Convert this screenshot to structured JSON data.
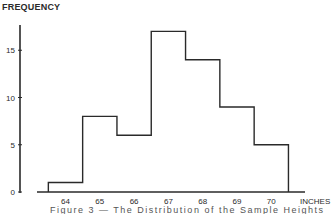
{
  "chart_data": {
    "type": "bar",
    "subtype": "histogram",
    "title": "",
    "ylabel": "FREQUENCY",
    "xlabel": "INCHES",
    "caption": "Figure 3 — The Distribution of the Sample Heights",
    "x_ticks": [
      64,
      65,
      66,
      67,
      68,
      69,
      70
    ],
    "y_ticks": [
      0,
      5,
      10,
      15
    ],
    "ylim": [
      0,
      18
    ],
    "xlim": [
      63,
      71
    ],
    "grid": false,
    "legend": null,
    "bins": [
      {
        "from": 63.5,
        "to": 64.5,
        "center": 64,
        "value": 1
      },
      {
        "from": 64.5,
        "to": 65.5,
        "center": 65,
        "value": 8
      },
      {
        "from": 65.5,
        "to": 66.5,
        "center": 66,
        "value": 6
      },
      {
        "from": 66.5,
        "to": 67.5,
        "center": 67,
        "value": 17
      },
      {
        "from": 67.5,
        "to": 68.5,
        "center": 68,
        "value": 14
      },
      {
        "from": 68.5,
        "to": 69.5,
        "center": 69,
        "value": 9
      },
      {
        "from": 69.5,
        "to": 70.5,
        "center": 70,
        "value": 5
      }
    ],
    "categories": [
      "64",
      "65",
      "66",
      "67",
      "68",
      "69",
      "70"
    ],
    "values": [
      1,
      8,
      6,
      17,
      14,
      9,
      5
    ],
    "line_color": "#2a2a2a"
  }
}
